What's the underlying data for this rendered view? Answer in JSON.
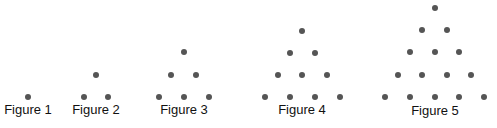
{
  "diagram": {
    "dot_color": "#555555",
    "figures": [
      {
        "label": "Figure 1",
        "label_pos": [
          28,
          103
        ],
        "dots": [
          [
            28,
            97
          ]
        ]
      },
      {
        "label": "Figure 2",
        "label_pos": [
          96,
          103
        ],
        "dots": [
          [
            96,
            75
          ],
          [
            84,
            97
          ],
          [
            108,
            97
          ]
        ]
      },
      {
        "label": "Figure 3",
        "label_pos": [
          184,
          103
        ],
        "dots": [
          [
            184,
            52
          ],
          [
            171,
            75
          ],
          [
            196,
            75
          ],
          [
            159,
            97
          ],
          [
            184,
            97
          ],
          [
            209,
            97
          ]
        ]
      },
      {
        "label": "Figure 4",
        "label_pos": [
          302,
          103
        ],
        "dots": [
          [
            302,
            31
          ],
          [
            290,
            53
          ],
          [
            315,
            53
          ],
          [
            278,
            75
          ],
          [
            302,
            75
          ],
          [
            327,
            75
          ],
          [
            265,
            97
          ],
          [
            290,
            97
          ],
          [
            315,
            97
          ],
          [
            340,
            97
          ]
        ]
      },
      {
        "label": "Figure 5",
        "label_pos": [
          435,
          104
        ],
        "dots": [
          [
            435,
            8
          ],
          [
            422,
            30
          ],
          [
            447,
            30
          ],
          [
            410,
            52
          ],
          [
            435,
            52
          ],
          [
            459,
            52
          ],
          [
            398,
            75
          ],
          [
            422,
            75
          ],
          [
            447,
            75
          ],
          [
            471,
            75
          ],
          [
            385,
            97
          ],
          [
            410,
            97
          ],
          [
            435,
            97
          ],
          [
            459,
            97
          ],
          [
            484,
            97
          ]
        ]
      }
    ]
  }
}
